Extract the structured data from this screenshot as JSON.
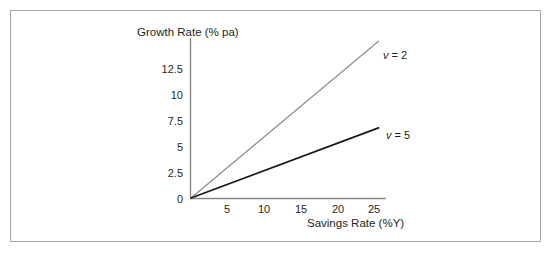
{
  "chart_data": {
    "type": "line",
    "title": "",
    "xlabel": "Savings Rate (%Y)",
    "ylabel": "Growth Rate (% pa)",
    "xlim": [
      0,
      26
    ],
    "ylim": [
      0,
      14.6
    ],
    "xticks": [
      5,
      10,
      15,
      20,
      25
    ],
    "xticklabels": [
      "5",
      "10",
      "15",
      "20",
      "25"
    ],
    "yticks": [
      0,
      2.5,
      5,
      7.5,
      10,
      12.5
    ],
    "yticklabels": [
      "0",
      "2.5",
      "5",
      "7.5",
      "10",
      "12.5"
    ],
    "grid": false,
    "legend_position": "inline-right-of-line-end",
    "series": [
      {
        "name": "v = 2",
        "variable": "v",
        "equals": "=",
        "value": "2",
        "color": "#8c8c8c",
        "linewidth": 1.2,
        "x": [
          0,
          25
        ],
        "values": [
          0,
          14.3
        ]
      },
      {
        "name": "v = 5",
        "variable": "v",
        "equals": "=",
        "value": "5",
        "color": "#1a1a1a",
        "linewidth": 1.8,
        "x": [
          0,
          25
        ],
        "values": [
          0,
          6.4
        ]
      }
    ],
    "axis_color": "#888888",
    "frame_color": "#a6a6a6",
    "text_color": "#231f20",
    "background": "#ffffff"
  }
}
